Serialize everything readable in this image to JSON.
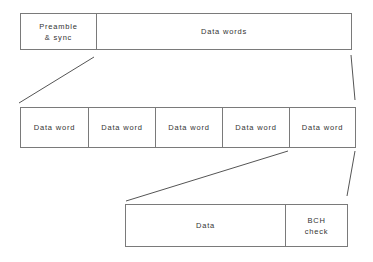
{
  "diagram": {
    "levels": [
      {
        "name": "frame",
        "fields": [
          {
            "label": "Preamble\n& sync"
          },
          {
            "label": "Data words"
          }
        ]
      },
      {
        "name": "data-words",
        "fields": [
          {
            "label": "Data word"
          },
          {
            "label": "Data word"
          },
          {
            "label": "Data word"
          },
          {
            "label": "Data word"
          },
          {
            "label": "Data word"
          }
        ]
      },
      {
        "name": "data-word",
        "fields": [
          {
            "label": "Data"
          },
          {
            "label": "BCH\ncheck"
          }
        ]
      }
    ],
    "expansions": [
      {
        "from": "frame.Data words",
        "to": "data-words"
      },
      {
        "from": "data-words.last Data word",
        "to": "data-word"
      }
    ],
    "colors": {
      "line": "#7a7a7a",
      "text": "#333333",
      "background": "#ffffff"
    }
  }
}
